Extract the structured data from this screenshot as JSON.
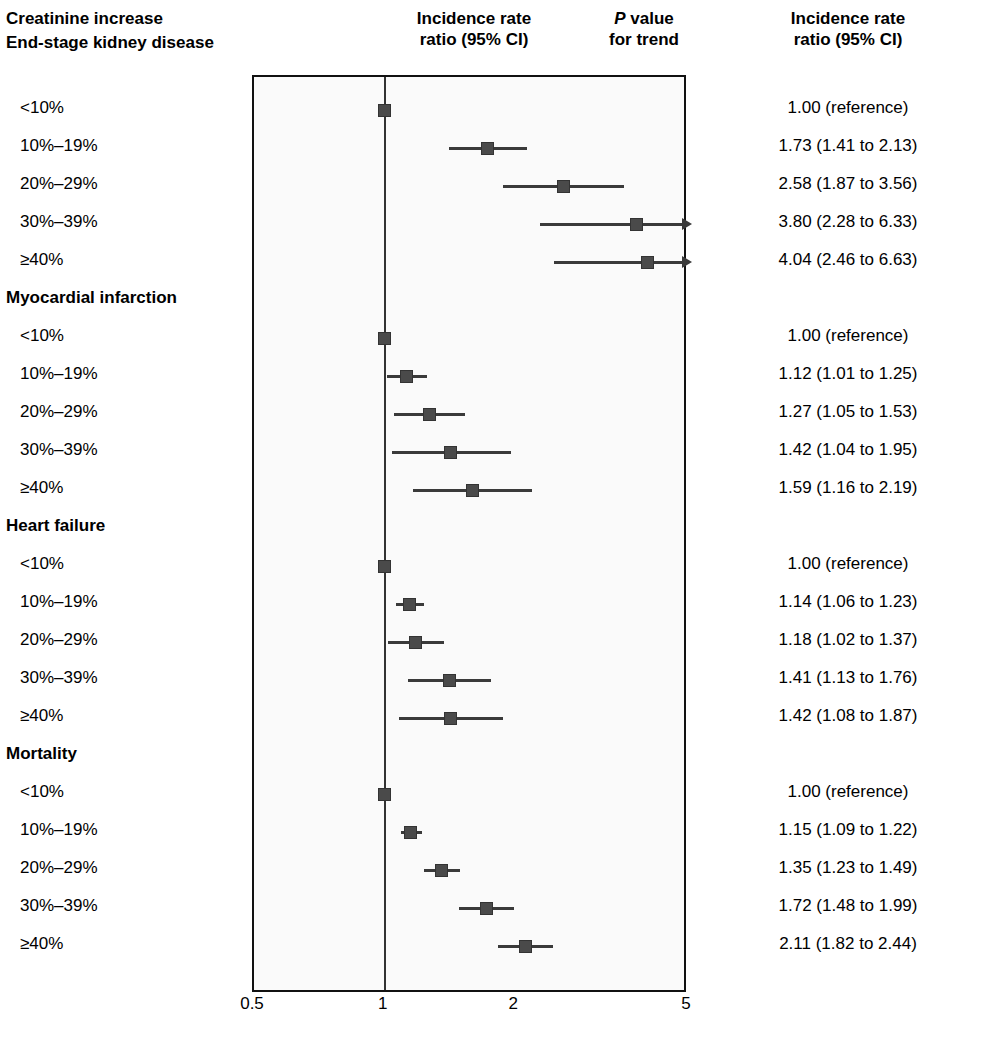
{
  "header": {
    "left_title": "Creatinine increase",
    "center_title_l1": "Incidence rate",
    "center_title_l2": "ratio (95% CI)",
    "p_title_l1_italic": "P",
    "p_title_l1_rest": " value",
    "p_title_l2": "for trend",
    "right_title_l1": "Incidence rate",
    "right_title_l2": "ratio (95% CI)"
  },
  "axis": {
    "ticks": [
      "0.5",
      "1",
      "2",
      "5"
    ],
    "tick_values": [
      0.5,
      1,
      2,
      5
    ],
    "min": 0.5,
    "max": 5,
    "scale": "log",
    "reference": 1
  },
  "chart_data": {
    "type": "forest",
    "title": "Incidence rate ratio (95% CI)",
    "xlabel": "",
    "ylabel": "",
    "xlim": [
      0.5,
      5
    ],
    "xscale": "log",
    "xticks": [
      0.5,
      1,
      2,
      5
    ],
    "reference_line": 1,
    "grid": false,
    "legend": "none",
    "category_label": "Creatinine increase",
    "groups": [
      {
        "name": "End-stage kidney disease",
        "p_trend": "<.001",
        "rows": [
          {
            "label": "<10%",
            "estimate": 1.0,
            "low": null,
            "high": null,
            "text": "1.00 (reference)",
            "truncated_high": false
          },
          {
            "label": "10%–19%",
            "estimate": 1.73,
            "low": 1.41,
            "high": 2.13,
            "text": "1.73 (1.41 to 2.13)",
            "truncated_high": false
          },
          {
            "label": "20%–29%",
            "estimate": 2.58,
            "low": 1.87,
            "high": 3.56,
            "text": "2.58 (1.87 to 3.56)",
            "truncated_high": false
          },
          {
            "label": "30%–39%",
            "estimate": 3.8,
            "low": 2.28,
            "high": 6.33,
            "text": "3.80 (2.28 to 6.33)",
            "truncated_high": true
          },
          {
            "label": "≥40%",
            "estimate": 4.04,
            "low": 2.46,
            "high": 6.63,
            "text": "4.04 (2.46 to 6.63)",
            "truncated_high": true
          }
        ]
      },
      {
        "name": "Myocardial infarction",
        "p_trend": "<.001",
        "rows": [
          {
            "label": "<10%",
            "estimate": 1.0,
            "low": null,
            "high": null,
            "text": "1.00 (reference)",
            "truncated_high": false
          },
          {
            "label": "10%–19%",
            "estimate": 1.12,
            "low": 1.01,
            "high": 1.25,
            "text": "1.12 (1.01 to 1.25)",
            "truncated_high": false
          },
          {
            "label": "20%–29%",
            "estimate": 1.27,
            "low": 1.05,
            "high": 1.53,
            "text": "1.27 (1.05 to 1.53)",
            "truncated_high": false
          },
          {
            "label": "30%–39%",
            "estimate": 1.42,
            "low": 1.04,
            "high": 1.95,
            "text": "1.42 (1.04 to 1.95)",
            "truncated_high": false
          },
          {
            "label": "≥40%",
            "estimate": 1.59,
            "low": 1.16,
            "high": 2.19,
            "text": "1.59 (1.16 to 2.19)",
            "truncated_high": false
          }
        ]
      },
      {
        "name": "Heart failure",
        "p_trend": "<.001",
        "rows": [
          {
            "label": "<10%",
            "estimate": 1.0,
            "low": null,
            "high": null,
            "text": "1.00 (reference)",
            "truncated_high": false
          },
          {
            "label": "10%–19%",
            "estimate": 1.14,
            "low": 1.06,
            "high": 1.23,
            "text": "1.14 (1.06 to 1.23)",
            "truncated_high": false
          },
          {
            "label": "20%–29%",
            "estimate": 1.18,
            "low": 1.02,
            "high": 1.37,
            "text": "1.18 (1.02 to 1.37)",
            "truncated_high": false
          },
          {
            "label": "30%–39%",
            "estimate": 1.41,
            "low": 1.13,
            "high": 1.76,
            "text": "1.41 (1.13 to 1.76)",
            "truncated_high": false
          },
          {
            "label": "≥40%",
            "estimate": 1.42,
            "low": 1.08,
            "high": 1.87,
            "text": "1.42 (1.08 to 1.87)",
            "truncated_high": false
          }
        ]
      },
      {
        "name": "Mortality",
        "p_trend": "<.001",
        "rows": [
          {
            "label": "<10%",
            "estimate": 1.0,
            "low": null,
            "high": null,
            "text": "1.00 (reference)",
            "truncated_high": false
          },
          {
            "label": "10%–19%",
            "estimate": 1.15,
            "low": 1.09,
            "high": 1.22,
            "text": "1.15 (1.09 to 1.22)",
            "truncated_high": false
          },
          {
            "label": "20%–29%",
            "estimate": 1.35,
            "low": 1.23,
            "high": 1.49,
            "text": "1.35 (1.23 to 1.49)",
            "truncated_high": false
          },
          {
            "label": "30%–39%",
            "estimate": 1.72,
            "low": 1.48,
            "high": 1.99,
            "text": "1.72 (1.48 to 1.99)",
            "truncated_high": false
          },
          {
            "label": "≥40%",
            "estimate": 2.11,
            "low": 1.82,
            "high": 2.44,
            "text": "2.11 (1.82 to 2.44)",
            "truncated_high": false
          }
        ]
      }
    ]
  },
  "colors": {
    "marker": "#4a4a4a",
    "line": "#3a3a3a",
    "frame": "#111111",
    "plot_bg": "#fafafa"
  }
}
